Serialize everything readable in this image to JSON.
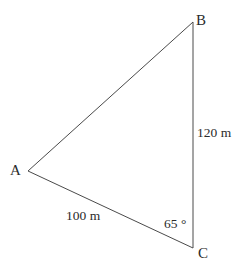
{
  "figure": {
    "type": "triangle-diagram",
    "background_color": "#ffffff",
    "stroke_color": "#4a4a4a",
    "text_color": "#2b2b2b",
    "stroke_width": 1
  },
  "vertices": {
    "a": {
      "label": "A",
      "x": 28,
      "y": 171
    },
    "b": {
      "label": "B",
      "x": 193,
      "y": 22
    },
    "c": {
      "label": "C",
      "x": 193,
      "y": 248
    }
  },
  "sides": {
    "bc": {
      "label": "120 m",
      "value": 120,
      "unit": "m",
      "from": "B",
      "to": "C"
    },
    "ac": {
      "label": "100 m",
      "value": 100,
      "unit": "m",
      "from": "A",
      "to": "C"
    },
    "ab": {
      "label": "",
      "from": "A",
      "to": "B"
    }
  },
  "angles": {
    "c": {
      "label": "65 °",
      "value": 65,
      "unit": "degrees",
      "at": "C"
    }
  }
}
